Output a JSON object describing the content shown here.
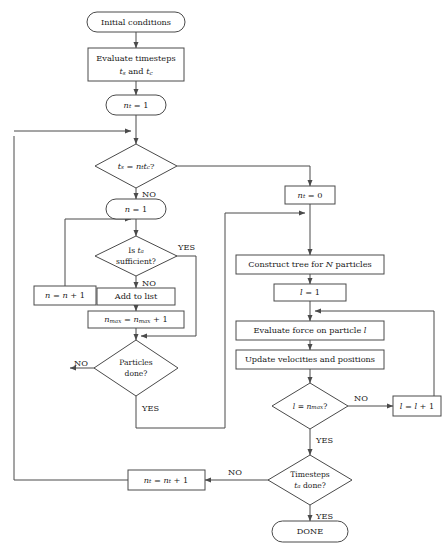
{
  "diagram": {
    "stroke_color": "#4a4a4a",
    "text_color": "#1a1a1a",
    "background": "#ffffff"
  },
  "nodes": {
    "initial_conditions": {
      "label": "Initial conditions",
      "shape": "stadium"
    },
    "evaluate_timesteps_line1": {
      "label": "Evaluate timesteps"
    },
    "evaluate_timesteps_line2": {
      "label": "ts and tc"
    },
    "nt_init": {
      "label": "nt = 1",
      "shape": "stadium"
    },
    "decision_ts_eq": {
      "label": "ts = nt tc?",
      "shape": "diamond"
    },
    "n_init": {
      "label": "n = 1",
      "shape": "stadium"
    },
    "decision_ts_sufficient_line1": {
      "label": "Is ta"
    },
    "decision_ts_sufficient_line2": {
      "label": "sufficient?"
    },
    "n_increment": {
      "label": "n = n + 1",
      "shape": "rect"
    },
    "add_to_list": {
      "label": "Add to list",
      "shape": "rect"
    },
    "nmax_increment": {
      "label": "nmax = nmax + 1",
      "shape": "rect"
    },
    "decision_particles_line1": {
      "label": "Particles"
    },
    "decision_particles_line2": {
      "label": "done?"
    },
    "nt_zero": {
      "label": "nt = 0",
      "shape": "rect"
    },
    "construct_tree": {
      "label": "Construct tree for N particles",
      "shape": "rect"
    },
    "l_init": {
      "label": "l = 1",
      "shape": "rect"
    },
    "evaluate_force": {
      "label": "Evaluate force on particle l",
      "shape": "rect"
    },
    "update_velocities": {
      "label": "Update velocities and positions",
      "shape": "rect"
    },
    "decision_l_eq_nmax": {
      "label": "l = nmax?",
      "shape": "diamond"
    },
    "l_increment": {
      "label": "l = l + 1",
      "shape": "rect"
    },
    "decision_timesteps_line1": {
      "label": "Timesteps"
    },
    "decision_timesteps_line2": {
      "label": "ta done?"
    },
    "nt_increment": {
      "label": "nt = nt + 1",
      "shape": "rect"
    },
    "done": {
      "label": "DONE",
      "shape": "stadium"
    }
  },
  "edge_labels": {
    "ts_eq_no": "NO",
    "sufficient_yes": "YES",
    "sufficient_no": "NO",
    "particles_no": "NO",
    "particles_yes": "YES",
    "l_eq_nmax_no": "NO",
    "l_eq_nmax_yes": "YES",
    "timesteps_no": "NO",
    "timesteps_yes": "YES"
  }
}
